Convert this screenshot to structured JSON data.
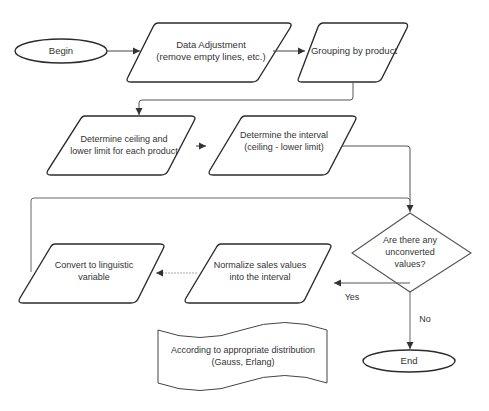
{
  "diagram": {
    "type": "flowchart",
    "colors": {
      "stroke": "#2b2b2b",
      "connector": "#555555",
      "text": "#333333",
      "background": "#ffffff"
    },
    "nodes": {
      "begin": {
        "shape": "terminator",
        "label": "Begin"
      },
      "data_adjustment": {
        "shape": "parallelogram",
        "label": "Data Adjustment\n(remove empty lines, etc.)"
      },
      "grouping": {
        "shape": "parallelogram",
        "label": "Grouping by product"
      },
      "ceiling_lower": {
        "shape": "parallelogram",
        "label": "Determine ceiling and\nlower limit for each product"
      },
      "interval": {
        "shape": "parallelogram",
        "label": "Determine the interval\n(ceiling - lower limit)"
      },
      "decision": {
        "shape": "diamond",
        "label": "Are there any\nunconverted\nvalues?"
      },
      "normalize": {
        "shape": "parallelogram",
        "label": "Normalize sales values\ninto the interval"
      },
      "convert": {
        "shape": "parallelogram",
        "label": "Convert to linguistic\nvariable"
      },
      "note": {
        "shape": "document",
        "label": "According to appropriate distribution\n(Gauss, Erlang)"
      },
      "end": {
        "shape": "terminator",
        "label": "End"
      }
    },
    "edges": [
      {
        "from": "begin",
        "to": "data_adjustment",
        "label": ""
      },
      {
        "from": "data_adjustment",
        "to": "grouping",
        "label": ""
      },
      {
        "from": "grouping",
        "to": "ceiling_lower",
        "label": ""
      },
      {
        "from": "ceiling_lower",
        "to": "interval",
        "label": ""
      },
      {
        "from": "interval",
        "to": "decision",
        "label": ""
      },
      {
        "from": "decision",
        "to": "normalize",
        "label": "Yes"
      },
      {
        "from": "normalize",
        "to": "convert",
        "label": ""
      },
      {
        "from": "convert",
        "to": "decision",
        "label": ""
      },
      {
        "from": "decision",
        "to": "end",
        "label": "No"
      }
    ],
    "edge_labels": {
      "yes": "Yes",
      "no": "No"
    }
  }
}
